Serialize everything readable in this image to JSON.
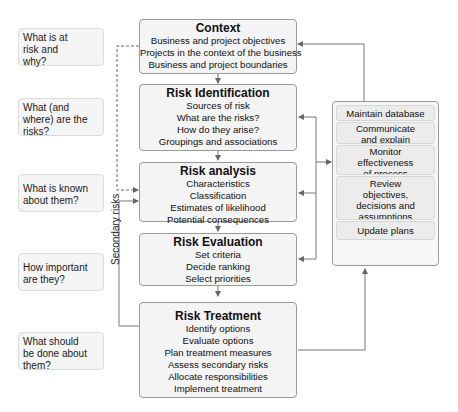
{
  "questions": [
    {
      "text": "What is at risk and why?",
      "lines": [
        "What is at",
        "risk and",
        "why?"
      ]
    },
    {
      "text": "What (and where) are the risks?",
      "lines": [
        "What (and",
        "where) are the",
        "risks?"
      ]
    },
    {
      "text": "What is known about them?",
      "lines": [
        "What is known",
        "about them?"
      ]
    },
    {
      "text": "How important are they?",
      "lines": [
        "How important",
        "are they?"
      ]
    },
    {
      "text": "What should be done about them?",
      "lines": [
        "What should",
        "be done about",
        "them?"
      ]
    }
  ],
  "stages": [
    {
      "title": "Context",
      "items": [
        "Business and project objectives",
        "Projects in the context of the business",
        "Business and project boundaries"
      ]
    },
    {
      "title": "Risk Identification",
      "items": [
        "Sources of risk",
        "What are the risks?",
        "How do they arise?",
        "Groupings and associations"
      ]
    },
    {
      "title": "Risk analysis",
      "items": [
        "Characteristics",
        "Classification",
        "Estimates of likelihood",
        "Potential consequences"
      ]
    },
    {
      "title": "Risk Evaluation",
      "items": [
        "Set criteria",
        "Decide ranking",
        "Select priorities"
      ]
    },
    {
      "title": "Risk Treatment",
      "items": [
        "Identify options",
        "Evaluate options",
        "Plan treatment measures",
        "Assess secondary risks",
        "Allocate responsibilities",
        "Implement treatment"
      ]
    }
  ],
  "panel": {
    "items": [
      {
        "lines": [
          "Maintain database"
        ]
      },
      {
        "lines": [
          "Communicate",
          "and explain"
        ]
      },
      {
        "lines": [
          "Monitor",
          "effectiveness",
          "of process"
        ]
      },
      {
        "lines": [
          "Review",
          "objectives,",
          "decisions and",
          "assumptions"
        ]
      },
      {
        "lines": [
          "Update plans"
        ]
      }
    ]
  },
  "labels": {
    "secondary_risks": "Secondary risks"
  },
  "colors": {
    "stage_border": "#9a9a9a",
    "stage_fill": "#f4f4f4",
    "question_fill": "#f5f5f5",
    "connector": "#777777"
  }
}
